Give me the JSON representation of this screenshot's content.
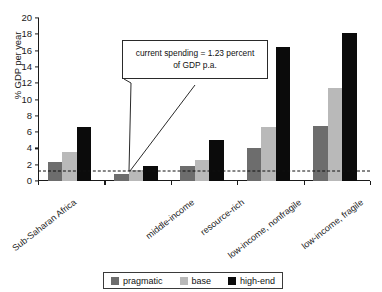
{
  "chart_data": {
    "type": "bar",
    "title": "",
    "subtitle": "",
    "xlabel": "",
    "ylabel": "% GDP per year",
    "ylim": [
      0,
      20
    ],
    "ytick_step": 2,
    "yticks": [
      0,
      2,
      4,
      6,
      8,
      10,
      12,
      14,
      16,
      18,
      20
    ],
    "grid": false,
    "legend_position": "bottom",
    "categories": [
      "Sub-Saharan Africa",
      "middle-income",
      "resource-rich",
      "low-income, nonfragile",
      "low-income, fragile"
    ],
    "series": [
      {
        "name": "pragmatic",
        "color": "#6d6d6d",
        "values": [
          2.3,
          0.85,
          1.9,
          4.1,
          6.7
        ]
      },
      {
        "name": "base",
        "color": "#b9b9b9",
        "values": [
          3.5,
          1.3,
          2.55,
          6.6,
          11.4
        ]
      },
      {
        "name": "high-end",
        "color": "#0b0b0b",
        "values": [
          6.6,
          1.9,
          5.05,
          16.4,
          18.2
        ]
      }
    ],
    "annotations": [
      {
        "name": "current-spending-callout",
        "text_line1": "current spending = 1.23 percent",
        "text_line2": "of GDP p.a.",
        "reference_value": 1.23,
        "reference_line_style": "dashed"
      }
    ]
  },
  "legend": {
    "items": [
      {
        "label": "pragmatic",
        "swatch": "pragmatic"
      },
      {
        "label": "base",
        "swatch": "base"
      },
      {
        "label": "high-end",
        "swatch": "highend"
      }
    ]
  }
}
